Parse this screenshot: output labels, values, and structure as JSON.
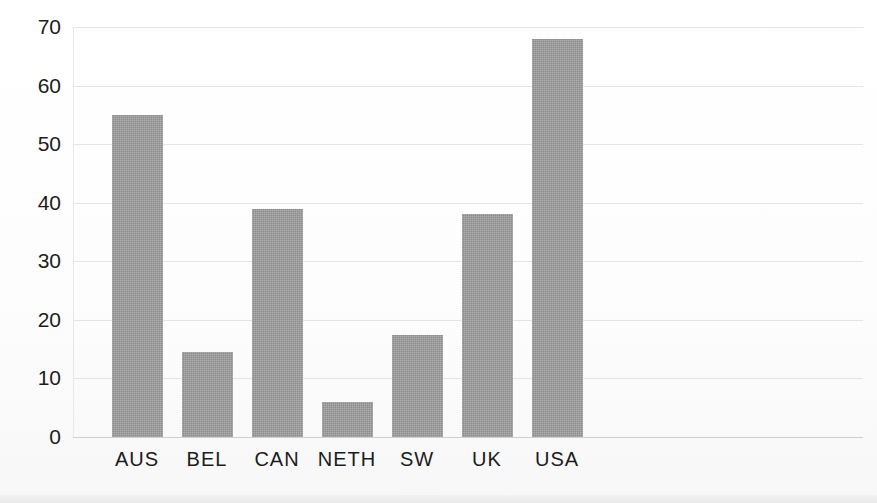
{
  "chart_data": {
    "type": "bar",
    "title": "",
    "subtitle": "",
    "xlabel": "",
    "ylabel": "",
    "categories": [
      "AUS",
      "BEL",
      "CAN",
      "NETH",
      "SW",
      "UK",
      "USA"
    ],
    "values": [
      55,
      14.5,
      39,
      6,
      17.5,
      38,
      68
    ],
    "ylim": [
      0,
      70
    ],
    "ytick_values": [
      0,
      10,
      20,
      30,
      40,
      50,
      60,
      70
    ],
    "ytick_labels": [
      "0",
      "10",
      "20",
      "30",
      "40",
      "50",
      "60",
      "70"
    ],
    "grid": true,
    "grid_axis": "y",
    "legend": false,
    "legend_position": "none",
    "series": [
      {
        "name": "",
        "values": [
          55,
          14.5,
          39,
          6,
          17.5,
          38,
          68
        ]
      }
    ]
  },
  "style": {
    "bar_color": "#8b8b8b",
    "gridline_color": "#e4e4e4",
    "axis_color": "#cfcfcf",
    "text_color": "#1c1c1c",
    "background": "#fdfdfd"
  },
  "artifacts": {
    "footer_smudge": "· · · · ·"
  }
}
